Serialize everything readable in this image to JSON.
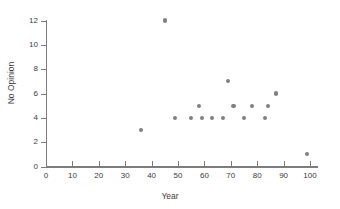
{
  "chart_data": {
    "type": "scatter",
    "title": "",
    "xlabel": "Year",
    "ylabel": "No Opinion",
    "xlim": [
      0,
      100
    ],
    "ylim": [
      0,
      12
    ],
    "xticks": [
      0,
      10,
      20,
      30,
      40,
      50,
      60,
      70,
      80,
      90,
      100
    ],
    "yticks": [
      0,
      2,
      4,
      6,
      8,
      10,
      12
    ],
    "grid": false,
    "legend": null,
    "marker": {
      "shape": "circle",
      "color": "#808080",
      "size": 4
    },
    "points": [
      {
        "x": 36,
        "y": 3
      },
      {
        "x": 45,
        "y": 12
      },
      {
        "x": 49,
        "y": 4
      },
      {
        "x": 55,
        "y": 4
      },
      {
        "x": 58,
        "y": 5
      },
      {
        "x": 59,
        "y": 4
      },
      {
        "x": 63,
        "y": 4
      },
      {
        "x": 67,
        "y": 4
      },
      {
        "x": 69,
        "y": 7
      },
      {
        "x": 71,
        "y": 5
      },
      {
        "x": 75,
        "y": 4
      },
      {
        "x": 78,
        "y": 5
      },
      {
        "x": 83,
        "y": 4
      },
      {
        "x": 84,
        "y": 5
      },
      {
        "x": 87,
        "y": 6
      },
      {
        "x": 99,
        "y": 1
      }
    ]
  },
  "colors": {
    "marker": "#808080",
    "axis": "#7d7d7d",
    "text": "#3a3a3a",
    "background": "#ffffff"
  }
}
